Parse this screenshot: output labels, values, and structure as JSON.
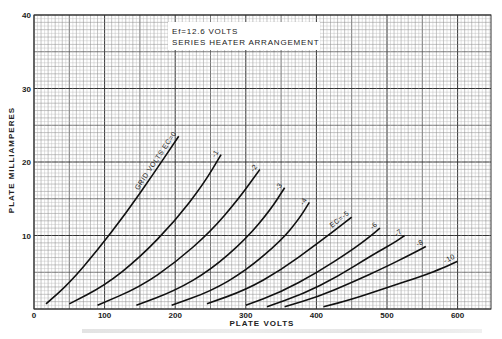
{
  "chart_data": {
    "type": "line",
    "title": "",
    "annotation": [
      "Ef=12.6 VOLTS",
      "SERIES HEATER ARRANGEMENT"
    ],
    "xlabel": "PLATE VOLTS",
    "ylabel": "PLATE MILLIAMPERES",
    "xlim": [
      0,
      647
    ],
    "ylim": [
      0,
      40
    ],
    "xticks": [
      0,
      100,
      200,
      300,
      400,
      500,
      600
    ],
    "yticks": [
      10,
      20,
      30,
      40
    ],
    "ytick_labels": [
      "10",
      "20",
      "30",
      "40"
    ],
    "xtick_labels": [
      "0",
      "100",
      "200",
      "300",
      "400",
      "500",
      "600"
    ],
    "y_zero_label": "0",
    "grid": true,
    "legend": "inline curve labels",
    "series": [
      {
        "name": "GRID VOLTS Ec=0",
        "label": "GRID VOLTS EC=0",
        "x": [
          17,
          50,
          90,
          130,
          170,
          205
        ],
        "y": [
          0.7,
          3.5,
          8,
          13,
          18.5,
          23.5
        ]
      },
      {
        "name": "-1",
        "label": "-1",
        "x": [
          50,
          100,
          150,
          200,
          240,
          265
        ],
        "y": [
          0.7,
          3.2,
          7,
          12,
          17,
          21
        ]
      },
      {
        "name": "-2",
        "label": "-2",
        "x": [
          90,
          150,
          200,
          250,
          290,
          320
        ],
        "y": [
          0.5,
          3,
          6.3,
          10.5,
          15,
          19
        ]
      },
      {
        "name": "-3",
        "label": "-3",
        "x": [
          145,
          200,
          250,
          300,
          335,
          355
        ],
        "y": [
          0.5,
          2.5,
          5.3,
          9.5,
          13.5,
          16.5
        ]
      },
      {
        "name": "-4",
        "label": "-4",
        "x": [
          195,
          250,
          300,
          350,
          375,
          390
        ],
        "y": [
          0.5,
          2.4,
          5.2,
          9.3,
          12.2,
          14.5
        ]
      },
      {
        "name": "Ec=-5",
        "label": "EC=-5",
        "x": [
          245,
          300,
          350,
          400,
          430,
          450
        ],
        "y": [
          0.7,
          2.6,
          5.3,
          8.8,
          11,
          12.5
        ]
      },
      {
        "name": "-6",
        "label": "-6",
        "x": [
          300,
          350,
          400,
          450,
          475,
          490
        ],
        "y": [
          0.5,
          2.3,
          4.9,
          8,
          9.8,
          11
        ]
      },
      {
        "name": "-7",
        "label": "-7",
        "x": [
          330,
          380,
          430,
          480,
          510,
          525
        ],
        "y": [
          0.3,
          2,
          4.4,
          7.4,
          9,
          10
        ]
      },
      {
        "name": "-8",
        "label": "-8",
        "x": [
          355,
          400,
          450,
          500,
          535,
          555
        ],
        "y": [
          0.3,
          1.6,
          3.6,
          5.8,
          7.5,
          8.5
        ]
      },
      {
        "name": "-10",
        "label": "-10",
        "x": [
          410,
          450,
          500,
          550,
          580,
          600
        ],
        "y": [
          0.3,
          1.3,
          2.9,
          4.5,
          5.6,
          6.5
        ]
      }
    ]
  },
  "caption": ""
}
